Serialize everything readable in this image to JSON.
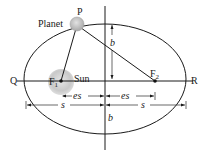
{
  "figure": {
    "labels": {
      "planet": "Planet",
      "point_p": "P",
      "sun": "Sun",
      "focus_1": "F",
      "focus_1_sub": "1",
      "focus_2": "F",
      "focus_2_sub": "2",
      "point_q": "Q",
      "point_r": "R",
      "semi_minor_top": "b",
      "semi_minor_bottom": "b",
      "es_left": "es",
      "es_right": "es",
      "s_left": "s",
      "s_right": "s"
    },
    "colors": {
      "stroke": "#1a1a1a",
      "sun_fill": "#c8c8c8",
      "planet_fill": "#bdbdbd",
      "background": "#ffffff"
    },
    "geometry": {
      "ellipse_center": [
        105,
        79
      ],
      "semi_major_px": 81,
      "semi_minor_px": 55,
      "focus_1": [
        61,
        81
      ],
      "focus_2": [
        155,
        81
      ],
      "planet": [
        77,
        25
      ]
    }
  }
}
